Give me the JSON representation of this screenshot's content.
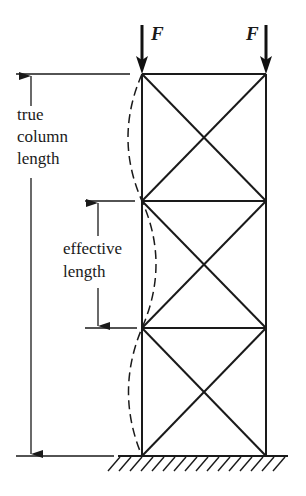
{
  "diagram": {
    "loads": [
      {
        "label": "F",
        "position": "left column top"
      },
      {
        "label": "F",
        "position": "right column top"
      }
    ],
    "dimensions": {
      "true_length": {
        "line1": "true",
        "line2": "column",
        "line3": "length"
      },
      "effective_length": {
        "line1": "effective",
        "line2": "length"
      }
    },
    "structure": {
      "bays": 3,
      "bracing": "X-braced",
      "support": "fixed ground (hatched)",
      "buckled_shape": "dashed sinusoidal curve, one half-wave per bay"
    },
    "colors": {
      "stroke": "#1a1a1a",
      "background": "#ffffff"
    }
  }
}
